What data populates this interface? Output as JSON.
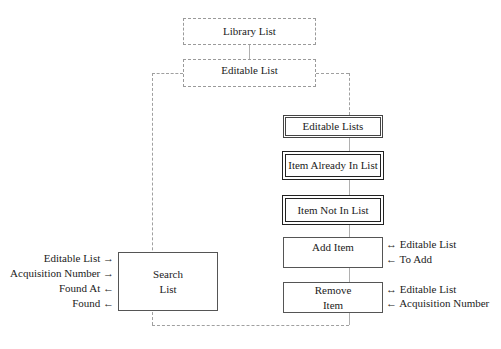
{
  "diagram": {
    "nodes": {
      "library_list": "Library List",
      "editable_list": "Editable List",
      "editable_lists": "Editable Lists",
      "item_already_in_list": "Item Already In List",
      "item_not_in_list": "Item Not In List",
      "add_item": "Add Item",
      "remove_item_line1": "Remove",
      "remove_item_line2": "Item",
      "search_list_line1": "Search",
      "search_list_line2": "List"
    },
    "search_list_params": [
      {
        "label": "Editable List",
        "arrow": "→"
      },
      {
        "label": "Acquisition Number",
        "arrow": "→"
      },
      {
        "label": "Found At",
        "arrow": "←"
      },
      {
        "label": "Found",
        "arrow": "←"
      }
    ],
    "add_item_params": [
      {
        "arrow": "↔",
        "label": "Editable List"
      },
      {
        "arrow": "←",
        "label": "To Add"
      }
    ],
    "remove_item_params": [
      {
        "arrow": "↔",
        "label": "Editable List"
      },
      {
        "arrow": "←",
        "label": "Acquisition Number"
      }
    ],
    "colors": {
      "dashed_line": "#a0a0a0",
      "box_border": "#444444",
      "text": "#222222"
    }
  }
}
